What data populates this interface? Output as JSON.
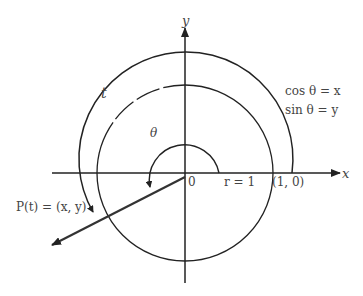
{
  "diagram": {
    "axes": {
      "x_label": "x",
      "y_label": "y",
      "origin_label": "0"
    },
    "labels": {
      "t": "t",
      "theta": "θ",
      "cos_eq": "cos θ = x",
      "sin_eq": "sin θ = y",
      "radius": "r = 1",
      "point_one_zero": "(1, 0)",
      "point_p": "P(t) = (x, y)"
    },
    "colors": {
      "stroke": "#222222",
      "text": "#444444",
      "background": "#ffffff"
    }
  }
}
